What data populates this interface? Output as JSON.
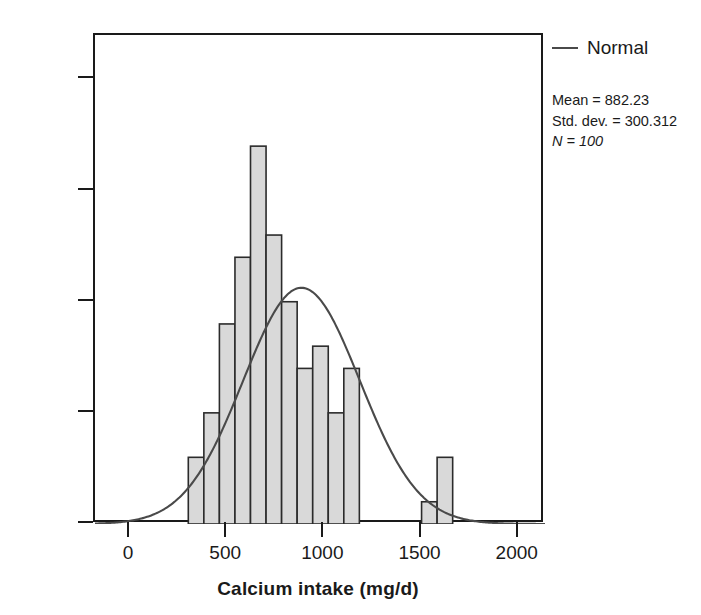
{
  "chart_data": {
    "type": "bar",
    "title": "",
    "subtitle": "",
    "xlabel": "Calcium intake (mg/d)",
    "ylabel": "Frequency",
    "xlim": [
      -180,
      2135
    ],
    "ylim": [
      0,
      22
    ],
    "xticks": [
      0,
      500,
      1000,
      1500,
      2000
    ],
    "xtick_labels": [
      "0",
      "500",
      "1000",
      "1500",
      "2000"
    ],
    "yticks": [
      0,
      5,
      10,
      15,
      20
    ],
    "ytick_labels": [
      "0",
      "5",
      "10",
      "15",
      "20"
    ],
    "grid": false,
    "legend_position": "outside-top-right",
    "bin_width": 80,
    "bin_starts": [
      300,
      380,
      460,
      540,
      620,
      700,
      780,
      860,
      940,
      1020,
      1100,
      1180,
      1260,
      1340,
      1500,
      1580
    ],
    "categories": [
      "300-380",
      "380-460",
      "460-540",
      "540-620",
      "620-700",
      "700-780",
      "780-860",
      "860-940",
      "940-1020",
      "1020-1100",
      "1100-1180",
      "1180-1260",
      "1260-1340",
      "1340-1420",
      "1500-1580",
      "1580-1660"
    ],
    "values": [
      3,
      5,
      9,
      12,
      17,
      13,
      10,
      7,
      8,
      5,
      7,
      0,
      0,
      0,
      1,
      3
    ],
    "series": [
      {
        "name": "Frequency",
        "type": "histogram",
        "values": [
          3,
          5,
          9,
          12,
          17,
          13,
          10,
          7,
          8,
          5,
          7,
          0,
          0,
          0,
          1,
          3
        ],
        "fill_color": "#d9d9d9",
        "edge_color": "#2b2b2b"
      },
      {
        "name": "Normal",
        "type": "line",
        "color": "#4a4a4a",
        "distribution": "normal",
        "mean": 882.23,
        "std_dev": 300.312,
        "n": 100,
        "scale_note": "N * bin_width * pdf(x); peak approx 13.3 at x = 882.23"
      }
    ],
    "annotations": [
      "Mean = 882.23",
      "Std. dev. = 300.312",
      "N = 100"
    ]
  },
  "legend": {
    "entry_label": "Normal",
    "swatch_name": "line-swatch"
  },
  "stats": {
    "mean_line": "Mean = 882.23",
    "std_dev_line": "Std. dev. = 300.312",
    "n_line": "N = 100",
    "mean_value": 882.23,
    "std_dev_value": 300.312,
    "n_value": 100
  },
  "axes": {
    "y_title": "Frequency",
    "x_title": "Calcium intake (mg/d)",
    "y_labels": [
      "0",
      "5",
      "10",
      "15",
      "20"
    ],
    "x_labels": [
      "0",
      "500",
      "1000",
      "1500",
      "2000"
    ]
  },
  "colors": {
    "bar_fill": "#d9d9d9",
    "bar_edge": "#2b2b2b",
    "curve": "#4a4a4a",
    "axis": "#1a1a1a",
    "background": "#ffffff"
  }
}
